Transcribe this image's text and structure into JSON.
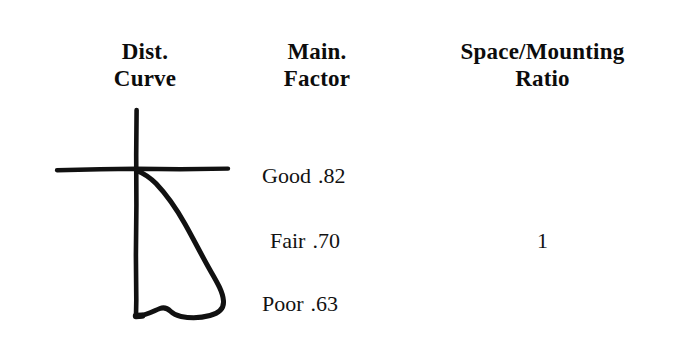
{
  "figure": {
    "background_color": "#ffffff",
    "ink_color": "#111111"
  },
  "columns": [
    {
      "id": "dist-curve",
      "header_line1": "Dist.",
      "header_line2": "Curve"
    },
    {
      "id": "main-factor",
      "header_line1": "Main.",
      "header_line2": "Factor"
    },
    {
      "id": "space-mounting-ratio",
      "header_line1": "Space/Mounting",
      "header_line2": "Ratio"
    }
  ],
  "rows": [
    {
      "factor_label": "Good",
      "factor_value": ".82",
      "ratio": ""
    },
    {
      "factor_label": "Fair",
      "factor_value": ".70",
      "ratio": "1"
    },
    {
      "factor_label": "Poor",
      "factor_value": ".63",
      "ratio": ""
    }
  ],
  "diagram": {
    "name": "distribution-curve-sketch",
    "axis": {
      "vertical_x": 106,
      "vertical_y_top": 15,
      "vertical_y_bottom": 221,
      "horizontal_y": 74,
      "horizontal_x_left": 27,
      "horizontal_x_right": 198
    },
    "curve_max_x": 193,
    "curve_notch_x": 145,
    "curve_notch_y": 200
  }
}
